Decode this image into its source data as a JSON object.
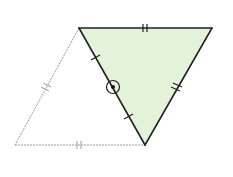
{
  "diagram": {
    "colors": {
      "background": "#ffffff",
      "fill": "#e4f2da",
      "solid_stroke": "#222222",
      "dashed_stroke": "#9a9a9a"
    },
    "vertices": {
      "A_top_left": [
        79,
        28
      ],
      "B_top_right": [
        212,
        28
      ],
      "C_bottom": [
        145,
        145
      ],
      "D_bottom_left": [
        15,
        145
      ]
    },
    "shaded_triangle": [
      "A_top_left",
      "B_top_right",
      "C_bottom"
    ],
    "dashed_triangle": [
      "A_top_left",
      "C_bottom",
      "D_bottom_left"
    ],
    "tick_marks": {
      "double_ticks": [
        "top edge A-B",
        "right edge B-C",
        "left dashed edge A-D",
        "bottom dashed edge D-C"
      ],
      "single_ticks": [
        "diagonal A-C (two marks, equal halves)"
      ]
    },
    "midpoint_marker": {
      "type": "circled-dot",
      "center": [
        113,
        87
      ],
      "radius": 6
    }
  }
}
